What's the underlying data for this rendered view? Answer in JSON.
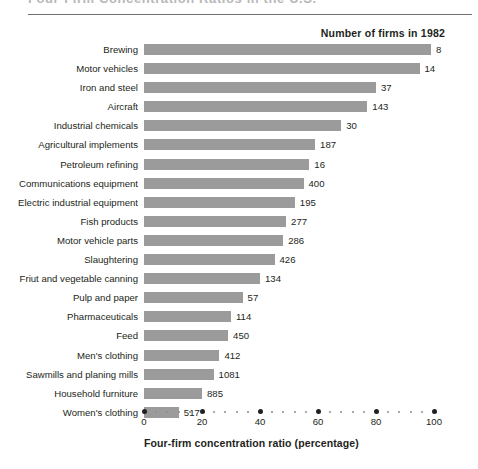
{
  "figure": {
    "title_clipped": "Four-Firm Concentration Ratios in the U.S.",
    "series_header": "Number of firms in 1982"
  },
  "chart_data": {
    "type": "bar",
    "orientation": "horizontal",
    "title": "Four-Firm Concentration Ratios in the U.S.",
    "xlabel": "Four-firm concentration ratio (percentage)",
    "ylabel": "",
    "xlim": [
      0,
      100
    ],
    "xticks": [
      0,
      20,
      40,
      60,
      80,
      100
    ],
    "xticklabels": [
      "0",
      "20",
      "40",
      "60",
      "80",
      "100"
    ],
    "minor_ticks_between_majors": 4,
    "grid": false,
    "legend": false,
    "bar_color": "#9b9b9b",
    "value_label_header": "Number of firms in 1982",
    "categories": [
      "Brewing",
      "Motor vehicles",
      "Iron and steel",
      "Aircraft",
      "Industrial chemicals",
      "Agricultural implements",
      "Petroleum refining",
      "Communications equipment",
      "Electric industrial equipment",
      "Fish products",
      "Motor vehicle parts",
      "Slaughtering",
      "Friut and vegetable canning",
      "Pulp and paper",
      "Pharmaceuticals",
      "Feed",
      "Men's clothing",
      "Sawmills and planing mills",
      "Household furniture",
      "Women's clothing"
    ],
    "values": [
      99,
      95,
      80,
      77,
      68,
      59,
      57,
      55,
      52,
      49,
      48,
      45,
      40,
      34,
      30,
      29,
      26,
      24,
      20,
      12
    ],
    "firm_counts": [
      8,
      14,
      37,
      143,
      30,
      187,
      16,
      400,
      195,
      277,
      286,
      426,
      134,
      57,
      114,
      450,
      412,
      1081,
      885,
      517
    ],
    "series": [
      {
        "name": "Four-firm concentration ratio (percentage)",
        "values": [
          99,
          95,
          80,
          77,
          68,
          59,
          57,
          55,
          52,
          49,
          48,
          45,
          40,
          34,
          30,
          29,
          26,
          24,
          20,
          12
        ]
      },
      {
        "name": "Number of firms in 1982",
        "values": [
          8,
          14,
          37,
          143,
          30,
          187,
          16,
          400,
          195,
          277,
          286,
          426,
          134,
          57,
          114,
          450,
          412,
          1081,
          885,
          517
        ]
      }
    ]
  }
}
